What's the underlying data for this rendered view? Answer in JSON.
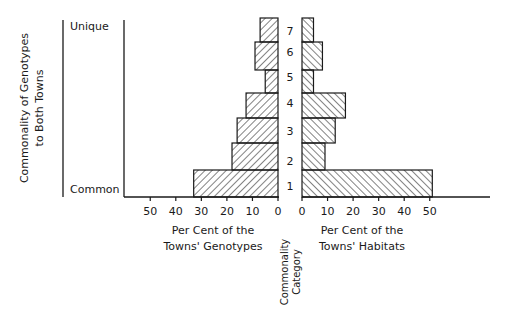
{
  "chart_data": {
    "type": "bar",
    "orientation": "horizontal",
    "layout": "back-to-back",
    "categories": [
      "1",
      "2",
      "3",
      "4",
      "5",
      "6",
      "7"
    ],
    "category_axis_label": "Commonality Category",
    "y_outer_label": "Commonality of Genotypes to Both Towns",
    "y_outer_label_lines": [
      "Commonality of Genotypes",
      "to Both Towns"
    ],
    "y_end_labels": {
      "top": "Unique",
      "bottom": "Common"
    },
    "series": [
      {
        "name": "Per Cent of the Towns' Genotypes",
        "side": "left",
        "xlabel_lines": [
          "Per Cent of the",
          "Towns' Genotypes"
        ],
        "values": [
          33,
          18,
          16,
          12.5,
          5,
          9,
          7
        ],
        "xlim": [
          0,
          60
        ],
        "ticks": [
          50,
          40,
          30,
          20,
          10,
          0
        ],
        "hatch": "forward-diagonal"
      },
      {
        "name": "Per Cent of the Towns' Habitats",
        "side": "right",
        "xlabel_lines": [
          "Per Cent of the",
          "Towns' Habitats"
        ],
        "values": [
          51,
          9,
          13,
          17,
          4.5,
          8,
          4.5
        ],
        "xlim": [
          0,
          73
        ],
        "ticks": [
          0,
          10,
          20,
          30,
          40,
          50
        ],
        "hatch": "back-diagonal"
      }
    ],
    "title": "",
    "grid": false,
    "legend": "none"
  }
}
